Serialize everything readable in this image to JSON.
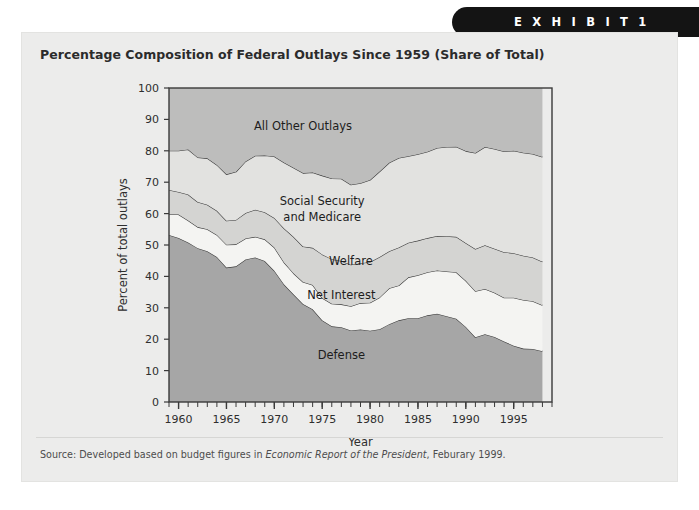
{
  "exhibit": {
    "label": "E X H I B I T   1"
  },
  "panel": {
    "title": "Percentage Composition of Federal Outlays Since 1959 (Share of Total)"
  },
  "source": {
    "prefix": "Source: Developed based on budget figures in ",
    "italic": "Economic Report of the President",
    "suffix": ", Feburary 1999."
  },
  "colors": {
    "page_background": "#ffffff",
    "panel_background": "#ececeb",
    "exhibit_pill": "#141414",
    "defense": "#a6a6a6",
    "net_interest": "#f4f4f2",
    "welfare": "#d4d4d2",
    "social_security": "#e2e2e0",
    "all_other": "#bdbdbc",
    "outline": "#3a3a3a",
    "axis": "#3a3a3a"
  },
  "chart_data": {
    "type": "area",
    "stacked": true,
    "title": "Percentage Composition of Federal Outlays Since 1959 (Share of Total)",
    "xlabel": "Year",
    "ylabel": "Percent of total outlays",
    "xlim": [
      1959,
      1999
    ],
    "ylim": [
      0,
      100
    ],
    "grid": false,
    "legend": "inline-band-labels",
    "x_tick_labels": [
      "1960",
      "1965",
      "1970",
      "1975",
      "1980",
      "1985",
      "1990",
      "1995"
    ],
    "x_tick_values": [
      1960,
      1965,
      1970,
      1975,
      1980,
      1985,
      1990,
      1995
    ],
    "x_minor_tick_step": 1,
    "y_tick_labels": [
      "0",
      "10",
      "20",
      "30",
      "40",
      "50",
      "60",
      "70",
      "80",
      "90",
      "100"
    ],
    "y_tick_values": [
      0,
      10,
      20,
      30,
      40,
      50,
      60,
      70,
      80,
      90,
      100
    ],
    "x": [
      1959,
      1960,
      1961,
      1962,
      1963,
      1964,
      1965,
      1966,
      1967,
      1968,
      1969,
      1970,
      1971,
      1972,
      1973,
      1974,
      1975,
      1976,
      1977,
      1978,
      1979,
      1980,
      1981,
      1982,
      1983,
      1984,
      1985,
      1986,
      1987,
      1988,
      1989,
      1990,
      1991,
      1992,
      1993,
      1994,
      1995,
      1996,
      1997,
      1998
    ],
    "series": [
      {
        "name": "Defense",
        "label": "Defense",
        "color": "#a6a6a6",
        "values": [
          53.2,
          52.2,
          50.8,
          49.0,
          48.0,
          46.2,
          42.8,
          43.2,
          45.4,
          46.0,
          44.9,
          41.8,
          37.5,
          34.3,
          31.2,
          29.5,
          26.0,
          24.1,
          23.8,
          22.8,
          23.1,
          22.7,
          23.2,
          24.8,
          26.0,
          26.7,
          26.7,
          27.6,
          28.1,
          27.3,
          26.5,
          23.9,
          20.6,
          21.6,
          20.7,
          19.3,
          17.9,
          17.0,
          16.9,
          16.2
        ]
      },
      {
        "name": "Net Interest",
        "label": "Net Interest",
        "color": "#f4f4f2",
        "values": [
          6.6,
          7.5,
          7.0,
          6.7,
          7.0,
          7.0,
          7.3,
          7.0,
          6.7,
          6.6,
          6.9,
          7.4,
          7.0,
          6.7,
          7.0,
          7.8,
          7.1,
          7.2,
          7.3,
          7.7,
          8.4,
          8.9,
          10.1,
          11.4,
          11.1,
          13.0,
          13.7,
          13.7,
          13.8,
          14.3,
          14.8,
          14.7,
          14.7,
          14.4,
          14.1,
          13.9,
          15.3,
          15.5,
          15.2,
          14.6
        ]
      },
      {
        "name": "Welfare",
        "label": "Welfare",
        "color": "#d4d4d2",
        "values": [
          7.7,
          7.2,
          8.3,
          8.0,
          7.8,
          7.7,
          7.6,
          7.8,
          8.1,
          8.6,
          8.6,
          9.4,
          10.8,
          11.6,
          11.3,
          11.8,
          13.9,
          14.2,
          13.8,
          13.2,
          12.7,
          13.0,
          12.9,
          11.8,
          12.1,
          11.0,
          11.0,
          10.9,
          11.0,
          11.2,
          11.3,
          12.0,
          13.4,
          13.9,
          14.0,
          14.5,
          14.2,
          14.1,
          13.9,
          13.9
        ]
      },
      {
        "name": "Social Security and Medicare",
        "label": "Social Security\nand Medicare",
        "color": "#e2e2e0",
        "values": [
          12.5,
          13.1,
          14.3,
          14.2,
          14.8,
          14.6,
          14.8,
          15.3,
          16.4,
          17.2,
          18.1,
          19.6,
          21.0,
          22.0,
          23.4,
          24.0,
          25.1,
          25.7,
          26.2,
          25.5,
          25.5,
          26.1,
          27.2,
          28.2,
          28.5,
          27.6,
          27.5,
          27.5,
          28.0,
          28.4,
          28.7,
          29.3,
          30.6,
          31.3,
          31.8,
          32.1,
          32.6,
          32.8,
          33.0,
          33.3
        ]
      },
      {
        "name": "All Other Outlays",
        "label": "All Other Outlays",
        "color": "#bdbdbc",
        "values": [
          20.0,
          20.0,
          19.6,
          22.1,
          22.4,
          24.5,
          27.5,
          26.7,
          23.4,
          21.6,
          21.5,
          21.8,
          23.7,
          25.4,
          27.1,
          26.9,
          27.9,
          28.8,
          28.9,
          30.8,
          30.3,
          29.3,
          26.6,
          23.8,
          22.3,
          21.7,
          21.1,
          20.3,
          19.1,
          18.8,
          18.7,
          20.1,
          20.7,
          18.8,
          19.4,
          20.2,
          20.0,
          20.6,
          21.0,
          22.0
        ]
      }
    ],
    "annotations": [
      {
        "text": "All Other Outlays",
        "x": 1973,
        "y": 88
      },
      {
        "text": "Social Security",
        "x": 1975,
        "y": 64
      },
      {
        "text": "and Medicare",
        "x": 1975,
        "y": 59
      },
      {
        "text": "Welfare",
        "x": 1978,
        "y": 45
      },
      {
        "text": "Net Interest",
        "x": 1977,
        "y": 34
      },
      {
        "text": "Defense",
        "x": 1977,
        "y": 15
      }
    ]
  }
}
